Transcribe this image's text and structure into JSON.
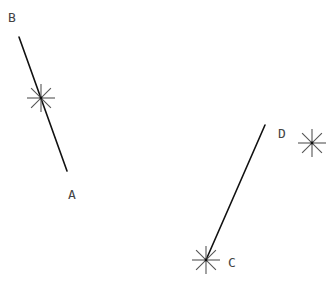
{
  "diagram": {
    "type": "geometry-segments",
    "colors": {
      "background": "#ffffff",
      "segment": "#111111",
      "marker": "#555555",
      "label": "#444444"
    },
    "segments": [
      {
        "id": "BA",
        "from": "B",
        "to": "A",
        "x1": 19,
        "y1": 37,
        "x2": 67,
        "y2": 171
      },
      {
        "id": "DC",
        "from": "D",
        "to": "C",
        "x1": 265,
        "y1": 125,
        "x2": 206,
        "y2": 260
      }
    ],
    "labels": [
      {
        "id": "B",
        "text": "B",
        "x": 8,
        "y": 22
      },
      {
        "id": "A",
        "text": "A",
        "x": 68,
        "y": 199
      },
      {
        "id": "D",
        "text": "D",
        "x": 278,
        "y": 138
      },
      {
        "id": "C",
        "text": "C",
        "x": 228,
        "y": 267
      }
    ],
    "markers": [
      {
        "id": "star-on-BA",
        "icon": "asterisk-marker",
        "cx": 41,
        "cy": 98,
        "r": 14
      },
      {
        "id": "star-D",
        "icon": "asterisk-marker",
        "cx": 312,
        "cy": 143,
        "r": 14
      },
      {
        "id": "star-C",
        "icon": "asterisk-marker",
        "cx": 206,
        "cy": 260,
        "r": 14
      }
    ]
  }
}
